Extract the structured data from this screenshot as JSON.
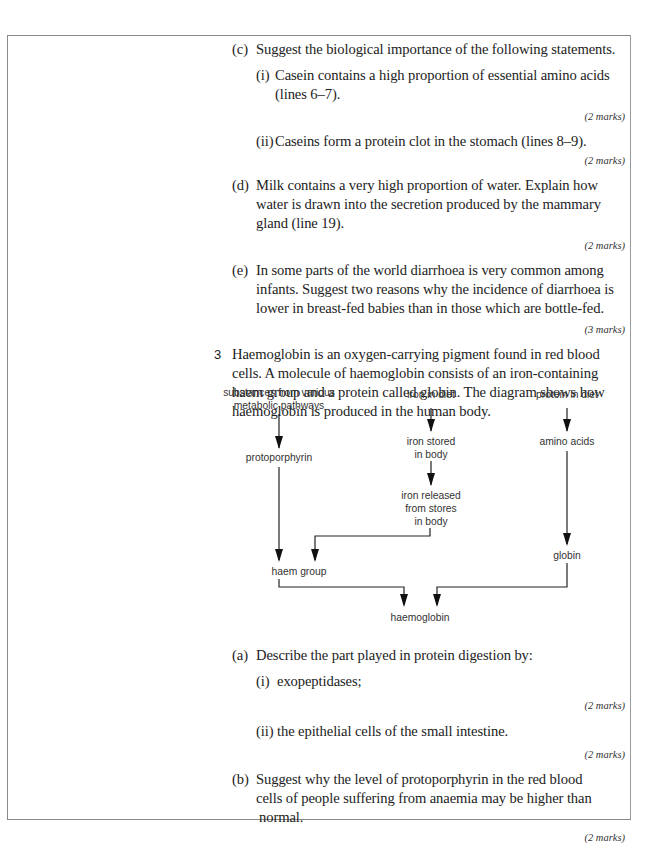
{
  "q2": {
    "c": {
      "label": "(c)",
      "text": "Suggest the biological importance of the following statements.",
      "i": {
        "label": "(i)",
        "line1": "Casein contains a high proportion of essential amino acids",
        "line2": "(lines 6–7).",
        "marks": "(2 marks)"
      },
      "ii": {
        "label": "(ii)",
        "line1": "Caseins form a protein clot in the stomach (lines 8–9).",
        "marks": "(2 marks)"
      }
    },
    "d": {
      "label": "(d)",
      "line1": "Milk contains a very high proportion of water. Explain how",
      "line2": "water is drawn into the secretion produced by the mammary",
      "line3": "gland (line 19).",
      "marks": "(2 marks)"
    },
    "e": {
      "label": "(e)",
      "line1": "In some parts of the world diarrhoea is very common among",
      "line2": "infants. Suggest two reasons why the incidence of diarrhoea is",
      "line3": "lower in breast-fed babies than in those which are bottle-fed.",
      "marks": "(3 marks)"
    }
  },
  "q3": {
    "number": "3",
    "line1": "Haemoglobin is an oxygen-carrying pigment found in red blood",
    "line2": "cells. A molecule of haemoglobin consists of an iron-containing",
    "line3": "haem group and a protein called globin. The diagram shows how",
    "line4": "haemoglobin is produced in the human body.",
    "diagram": {
      "substances_l1": "substances from various",
      "substances_l2": "metabolic pathways",
      "protoporphyrin": "protoporphyrin",
      "iron_diet": "iron in diet",
      "iron_stored_l1": "iron stored",
      "iron_stored_l2": "in body",
      "iron_released_l1": "iron released",
      "iron_released_l2": "from stores",
      "iron_released_l3": "in body",
      "protein_diet": "protein in diet",
      "amino_acids": "amino acids",
      "globin": "globin",
      "haem_group": "haem group",
      "haemoglobin": "haemoglobin"
    },
    "a": {
      "label": "(a)",
      "text": "Describe the part played in protein digestion by:",
      "i": {
        "label": "(i)",
        "text": "exopeptidases;",
        "marks": "(2 marks)"
      },
      "ii": {
        "label": "(ii)",
        "text": "the epithelial cells of the small intestine.",
        "marks": "(2 marks)"
      }
    },
    "b": {
      "label": "(b)",
      "line1": "Suggest why the level of protoporphyrin in the red blood",
      "line2": "cells of people suffering from anaemia may be higher than",
      "line3": "normal.",
      "marks": "(2 marks)"
    }
  }
}
